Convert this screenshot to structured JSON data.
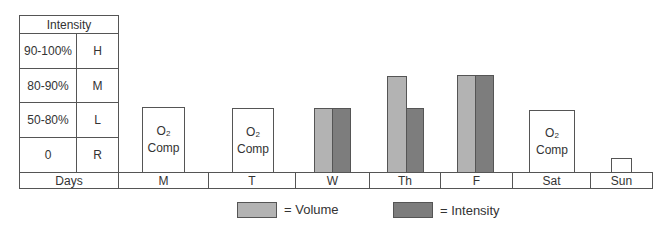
{
  "intensity_table": {
    "header": "Intensity",
    "rows": [
      {
        "range": "90-100%",
        "code": "H"
      },
      {
        "range": "80-90%",
        "code": "M"
      },
      {
        "range": "50-80%",
        "code": "L"
      },
      {
        "range": "0",
        "code": "R"
      }
    ],
    "days_label": "Days"
  },
  "days": [
    {
      "label": "M",
      "type": "o2comp",
      "o2_text": "O",
      "o2_sub": "2",
      "comp_text": "Comp"
    },
    {
      "label": "T",
      "type": "o2comp",
      "o2_text": "O",
      "o2_sub": "2",
      "comp_text": "Comp"
    },
    {
      "label": "W",
      "type": "bars",
      "volume": "L",
      "intensity": "L"
    },
    {
      "label": "Th",
      "type": "bars",
      "volume": "H",
      "intensity": "L"
    },
    {
      "label": "F",
      "type": "bars",
      "volume": "H",
      "intensity": "H"
    },
    {
      "label": "Sat",
      "type": "o2comp",
      "o2_text": "O",
      "o2_sub": "2",
      "comp_text": "Comp"
    },
    {
      "label": "Sun",
      "type": "rest"
    }
  ],
  "legend": {
    "volume_label": "= Volume",
    "intensity_label": "= Intensity"
  },
  "colors": {
    "volume": "#b3b3b3",
    "intensity": "#7d7d7d",
    "border": "#555555"
  }
}
